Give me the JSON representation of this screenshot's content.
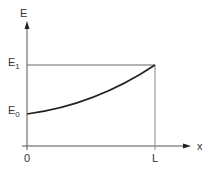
{
  "diagram": {
    "type": "energy-vs-position",
    "axes": {
      "y_label": "E",
      "x_label": "x"
    },
    "levels": {
      "e1_label": "E",
      "e1_sub": "1",
      "e0_label": "E",
      "e0_sub": "0"
    },
    "x_ticks": {
      "origin": "0",
      "end": "L"
    },
    "curve": {
      "description": "Convex increasing curve from E0 at x=0 to E1 at x=L",
      "start": {
        "x": "0",
        "y": "E0"
      },
      "end": {
        "x": "L",
        "y": "E1"
      }
    },
    "colors": {
      "axis": "#555555",
      "curve": "#222222",
      "guide": "#777777",
      "text": "#333333"
    }
  }
}
